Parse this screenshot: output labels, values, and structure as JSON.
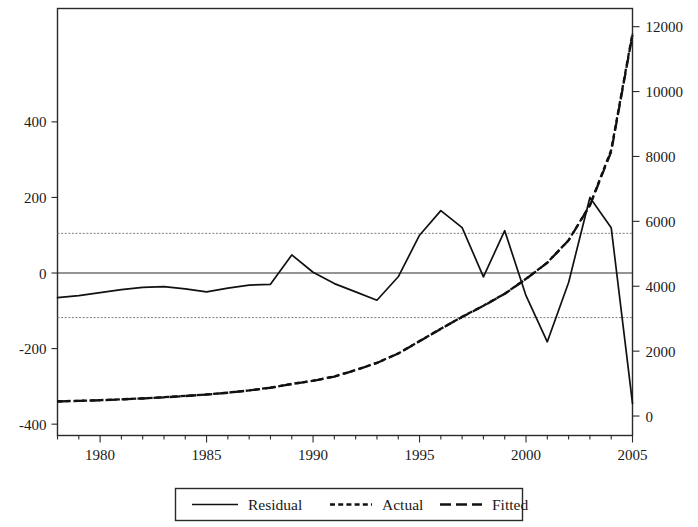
{
  "chart_data": {
    "type": "line",
    "title": "",
    "subtitle": "",
    "xlabel": "",
    "ylabel": "",
    "grid": false,
    "legend_position": "bottom-center",
    "x": [
      1978,
      1979,
      1980,
      1981,
      1982,
      1983,
      1984,
      1985,
      1986,
      1987,
      1988,
      1989,
      1990,
      1991,
      1992,
      1993,
      1994,
      1995,
      1996,
      1997,
      1998,
      1999,
      2000,
      2001,
      2002,
      2003,
      2004,
      2005
    ],
    "x_tick_labels": [
      "1980",
      "1985",
      "1990",
      "1995",
      "2000",
      "2005"
    ],
    "x_major_ticks": [
      1980,
      1985,
      1990,
      1995,
      2000,
      2005
    ],
    "x_minor_tick_step": 1,
    "xlim": [
      1978,
      2005
    ],
    "left_axis": {
      "name": "Residual",
      "tick_labels": [
        "400",
        "200",
        "0",
        "-200",
        "-400"
      ],
      "ticks": [
        400,
        200,
        0,
        -200,
        -400
      ],
      "ylim": [
        -430,
        700
      ]
    },
    "right_axis": {
      "name": "Actual / Fitted",
      "tick_labels": [
        "0",
        "2000",
        "4000",
        "6000",
        "8000",
        "10000",
        "12000"
      ],
      "ticks": [
        0,
        2000,
        4000,
        6000,
        8000,
        10000,
        12000
      ],
      "ylim": [
        -600,
        12560
      ]
    },
    "reference_bands": {
      "upper": 105,
      "lower": -118,
      "zero": 0
    },
    "series": [
      {
        "name": "Residual",
        "axis": "left",
        "style": "solid",
        "values": [
          -65,
          -60,
          -52,
          -44,
          -38,
          -36,
          -42,
          -50,
          -40,
          -32,
          -30,
          48,
          2,
          -28,
          -50,
          -72,
          -10,
          100,
          165,
          120,
          -10,
          112,
          -60,
          -182,
          -25,
          200,
          120,
          -345
        ]
      },
      {
        "name": "Actual",
        "axis": "right",
        "style": "dotted",
        "values": [
          452,
          470,
          490,
          515,
          545,
          580,
          620,
          665,
          720,
          790,
          875,
          990,
          1090,
          1220,
          1420,
          1640,
          1930,
          2310,
          2690,
          3060,
          3400,
          3770,
          4230,
          4730,
          5420,
          6500,
          8200,
          11800
        ]
      },
      {
        "name": "Fitted",
        "axis": "right",
        "style": "dashed",
        "values": [
          448,
          466,
          487,
          512,
          541,
          576,
          617,
          662,
          718,
          788,
          872,
          985,
          1086,
          1216,
          1415,
          1636,
          1925,
          2305,
          2685,
          3055,
          3395,
          3765,
          4225,
          4725,
          5415,
          6490,
          8150,
          11750
        ]
      }
    ]
  },
  "legend": {
    "entries": [
      {
        "label": "Residual",
        "style": "solid"
      },
      {
        "label": "Actual",
        "style": "dotted"
      },
      {
        "label": "Fitted",
        "style": "dashed"
      }
    ]
  }
}
